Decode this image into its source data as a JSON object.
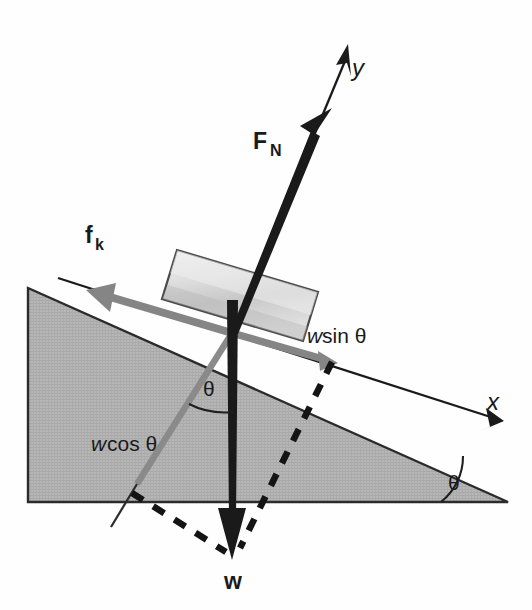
{
  "figure": {
    "kind": "free-body-diagram",
    "background_color": "#fefefe"
  },
  "colors": {
    "incline_fill": "#b4b4b4",
    "incline_stroke": "#2b2b2b",
    "block_fill_light": "#e8e8e8",
    "block_fill_dark": "#b8b8b8",
    "block_stroke": "#4a4a4a",
    "vector_black": "#1a1a1a",
    "vector_gray": "#808080",
    "axis_line": "#1a1a1a",
    "dashed_line": "#141414",
    "label_text": "#1a1a1a"
  },
  "labels": {
    "normal_force": "F",
    "normal_force_sub": "N",
    "friction": "f",
    "friction_sub": "k",
    "weight": "w",
    "axis_x": "x",
    "axis_y": "y",
    "w_sin_var": "w",
    "w_sin_fn": "sin θ",
    "w_cos_var": "w",
    "w_cos_fn": "cos θ",
    "theta_incline": "θ",
    "theta_weight": "θ"
  },
  "vectors": [
    {
      "name": "normal-force",
      "symbol": "F_N",
      "color": "#1a1a1a",
      "style": "solid-thick",
      "direction": "perpendicular to incline surface, up-right",
      "tail": [
        232,
        333
      ],
      "tip": [
        331,
        112
      ]
    },
    {
      "name": "kinetic-friction",
      "symbol": "f_k",
      "color": "#808080",
      "style": "solid-thick",
      "direction": "up the incline (negative x), toward upper-left",
      "tail": [
        232,
        333
      ],
      "tip": [
        79,
        288
      ]
    },
    {
      "name": "weight",
      "symbol": "w",
      "color": "#1a1a1a",
      "style": "solid-thick",
      "direction": "straight down (vertical)",
      "tail": [
        232,
        333
      ],
      "tip": [
        232,
        556
      ]
    },
    {
      "name": "weight-component-parallel",
      "symbol": "w sin θ",
      "color": "#808080",
      "style": "solid-thick",
      "direction": "down the incline (positive x)",
      "tail": [
        232,
        333
      ],
      "tip": [
        335,
        363
      ]
    },
    {
      "name": "weight-component-perpendicular",
      "symbol": "w cos θ",
      "color": "#808080",
      "style": "solid-thick",
      "direction": "into the incline, down-left",
      "tail": [
        232,
        333
      ],
      "tip": [
        135,
        487
      ]
    }
  ],
  "axes": [
    {
      "name": "x-axis",
      "label": "x",
      "direction": "down the slope to the lower right",
      "from": [
        60,
        280
      ],
      "to": [
        500,
        420
      ]
    },
    {
      "name": "y-axis",
      "label": "y",
      "direction": "perpendicular to slope, upper right",
      "from": [
        232,
        333
      ],
      "to": [
        352,
        45
      ]
    }
  ],
  "angles": [
    {
      "name": "incline-angle",
      "label": "θ",
      "location": "bottom-right corner of the wedge between the slope and the horizontal base"
    },
    {
      "name": "weight-decomposition-angle",
      "label": "θ",
      "location": "between the vertical weight vector and the w cos θ component"
    }
  ],
  "shapes": [
    {
      "name": "inclined-plane",
      "kind": "wedge",
      "fill": "#b4b4b4",
      "hatched": true,
      "vertices": [
        [
          28,
          288
        ],
        [
          432,
          429
        ],
        [
          508,
          502
        ],
        [
          28,
          502
        ]
      ]
    },
    {
      "name": "sliding-block",
      "kind": "rotated-rectangle",
      "fill": "gradient light gray",
      "vertices": [
        [
          177,
          250
        ],
        [
          318,
          292
        ],
        [
          303,
          341
        ],
        [
          162,
          299
        ]
      ]
    }
  ],
  "construction_lines": [
    {
      "name": "dashed-parallel-projection",
      "style": "dashed",
      "from": [
        335,
        363
      ],
      "to": [
        232,
        556
      ]
    },
    {
      "name": "dashed-perpendicular-projection",
      "style": "dashed",
      "from": [
        135,
        487
      ],
      "to": [
        232,
        556
      ]
    },
    {
      "name": "w-cos-extension",
      "style": "thin-solid",
      "from": [
        135,
        487
      ],
      "to": [
        108,
        530
      ]
    }
  ]
}
